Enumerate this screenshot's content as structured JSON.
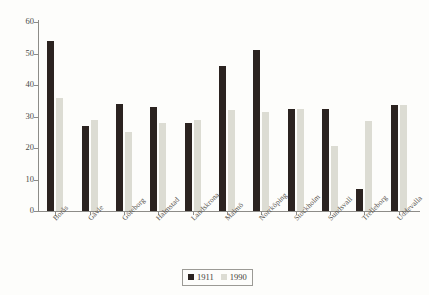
{
  "chart_data": {
    "type": "bar",
    "title": "",
    "subtitle": "",
    "xlabel": "",
    "ylabel": "",
    "ylim": [
      0,
      60
    ],
    "ytick_values": [
      0,
      10,
      20,
      30,
      40,
      50,
      60
    ],
    "ytick_labels": [
      "0",
      "10",
      "20",
      "30",
      "40",
      "50",
      "60"
    ],
    "grid": false,
    "legend_position": "bottom-center",
    "categories": [
      "Borås",
      "Gävle",
      "Göteborg",
      "Halmstad",
      "Landskrona",
      "Malmö",
      "Norrköping",
      "Stockholm",
      "Sundsvall",
      "Trelleborg",
      "Uddevalla"
    ],
    "series": [
      {
        "name": "1911",
        "color": "#2b2320",
        "values": [
          54,
          27,
          34,
          33,
          28,
          46,
          51,
          32.5,
          32.5,
          7,
          33.5
        ]
      },
      {
        "name": "1990",
        "color": "#dcdcd3",
        "values": [
          36,
          29,
          25,
          28,
          29,
          32,
          31.5,
          32.5,
          20.5,
          28.5,
          33.5
        ]
      }
    ]
  },
  "legend": {
    "entries": [
      {
        "label": "1911",
        "swatch": "legend-swatch-1911"
      },
      {
        "label": "1990",
        "swatch": "legend-swatch-1990"
      }
    ]
  }
}
